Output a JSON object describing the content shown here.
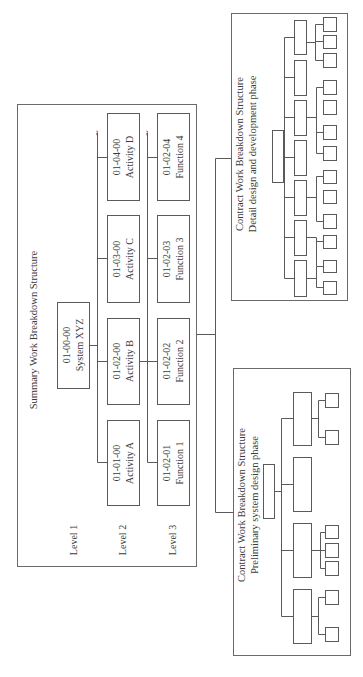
{
  "summary": {
    "title": "Summary Work Breakdown Structure",
    "levels": [
      "Level 1",
      "Level 2",
      "Level 3"
    ],
    "level1": {
      "code": "01-00-00",
      "name": "System XYZ"
    },
    "level2": [
      {
        "code": "01-01-00",
        "name": "Activity A"
      },
      {
        "code": "01-02-00",
        "name": "Activity B"
      },
      {
        "code": "01-03-00",
        "name": "Activity C"
      },
      {
        "code": "01-04-00",
        "name": "Activity D"
      }
    ],
    "level3": [
      {
        "code": "01-02-01",
        "name": "Function 1"
      },
      {
        "code": "01-02-02",
        "name": "Function 2"
      },
      {
        "code": "01-02-03",
        "name": "Function 3"
      },
      {
        "code": "01-02-04",
        "name": "Function 4"
      }
    ],
    "continuation_mark": "~"
  },
  "contract_preliminary": {
    "title_line1": "Contract Work Breakdown Structure",
    "title_line2": "Preliminary system design phase",
    "branches": 4,
    "leaves_per_branch": [
      2,
      3,
      0,
      2
    ]
  },
  "contract_detail": {
    "title_line1": "Contract Work Breakdown Structure",
    "title_line2": "Detail design and development phase",
    "branches": 7,
    "leaves_per_branch": [
      3,
      0,
      3,
      0,
      2,
      2,
      2
    ]
  },
  "colors": {
    "line": "#5a5a5a",
    "text": "#3a3a3a",
    "background": "#ffffff"
  }
}
